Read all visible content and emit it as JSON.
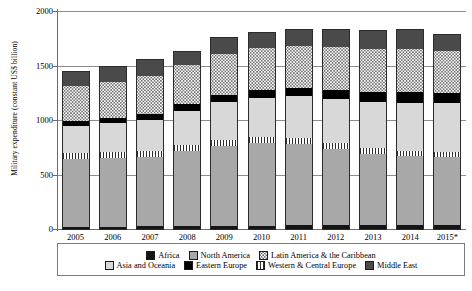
{
  "chart_data": {
    "type": "bar",
    "title": "",
    "xlabel": "",
    "ylabel": "Military expenditure (constant US$ billion)",
    "ylim": [
      0,
      2000
    ],
    "yticks": [
      0,
      500,
      1000,
      1500,
      2000
    ],
    "grid": true,
    "stacked": true,
    "legend_position": "bottom",
    "categories": [
      "2005",
      "2006",
      "2007",
      "2008",
      "2009",
      "2010",
      "2011",
      "2012",
      "2013",
      "2014",
      "2015*"
    ],
    "series": [
      {
        "name": "Africa",
        "swatch": "africa",
        "values": [
          20,
          22,
          24,
          27,
          30,
          31,
          34,
          37,
          41,
          41,
          37
        ]
      },
      {
        "name": "North America",
        "swatch": "namerica",
        "values": [
          618,
          628,
          638,
          688,
          735,
          760,
          750,
          700,
          650,
          625,
          620
        ]
      },
      {
        "name": "Western & Central Europe",
        "swatch": "wceurope",
        "values": [
          58,
          57,
          56,
          55,
          56,
          55,
          53,
          52,
          52,
          52,
          52
        ]
      },
      {
        "name": "Asia and Oceania",
        "swatch": "asia",
        "values": [
          250,
          265,
          285,
          310,
          340,
          360,
          380,
          400,
          420,
          440,
          450
        ]
      },
      {
        "name": "Eastern Europe",
        "swatch": "eeurope",
        "values": [
          45,
          50,
          57,
          64,
          70,
          72,
          78,
          85,
          92,
          95,
          88
        ]
      },
      {
        "name": "Latin America & the Caribbean",
        "swatch": "latam",
        "values": [
          318,
          330,
          348,
          360,
          372,
          380,
          385,
          392,
          398,
          395,
          385
        ]
      },
      {
        "name": "Middle East",
        "swatch": "meast",
        "values": [
          131,
          138,
          142,
          120,
          147,
          142,
          150,
          164,
          167,
          182,
          148
        ]
      }
    ],
    "totals": [
      1440,
      1490,
      1550,
      1624,
      1750,
      1800,
      1830,
      1830,
      1820,
      1830,
      1780
    ]
  },
  "legend": {
    "rows": [
      [
        {
          "label": "Africa",
          "swatch": "africa"
        },
        {
          "label": "North America",
          "swatch": "namerica"
        },
        {
          "label": "Latin America & the Caribbean",
          "swatch": "latam"
        }
      ],
      [
        {
          "label": "Asia and Oceania",
          "swatch": "asia"
        },
        {
          "label": "Eastern Europe",
          "swatch": "eeurope"
        },
        {
          "label": "Western & Central Europe",
          "swatch": "wceurope"
        },
        {
          "label": "Middle East",
          "swatch": "meast"
        }
      ]
    ]
  },
  "colors": {
    "africa": "#151515",
    "namerica": "#a8a8a8",
    "wceurope": "#ffffff",
    "asia": "#d8d8d8",
    "eeurope": "#000000",
    "latam": "#ffffff",
    "meast": "#4a4a4a",
    "axis": "#6b6b6b",
    "grid": "#8d8d8d"
  }
}
